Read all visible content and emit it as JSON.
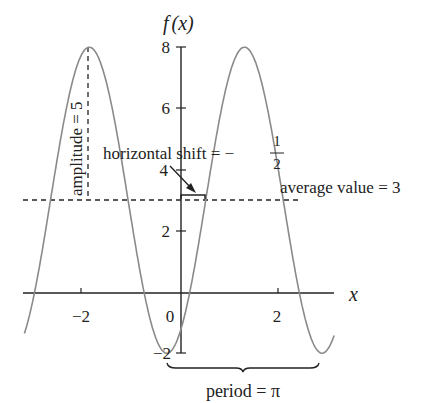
{
  "chart_data": {
    "type": "line",
    "title": "",
    "function": "f(x) = 5 sin(2(x - 1/2)) + 3",
    "xlabel": "x",
    "ylabel": "f (x)",
    "xlim": [
      -3.17,
      3.1
    ],
    "ylim": [
      -2,
      8
    ],
    "x_ticks": [
      -2,
      0,
      2
    ],
    "x_tick_labels": [
      "−2",
      "0",
      "2"
    ],
    "y_ticks": [
      -2,
      2,
      4,
      6,
      8
    ],
    "y_tick_labels": [
      "−2",
      "2",
      "4",
      "6",
      "8"
    ],
    "grid": false,
    "series": [
      {
        "name": "f(x)",
        "color": "#8a8a8a",
        "amplitude": 5,
        "average": 3,
        "period": 3.14159,
        "phase_shift": 0.5,
        "maxima_x": [
          -1.856,
          1.285
        ],
        "minima_x": [
          -0.285,
          2.856
        ],
        "max_value": 8,
        "min_value": -2
      }
    ],
    "annotations": [
      {
        "id": "amplitude",
        "text": "amplitude = 5",
        "orientation": "vertical"
      },
      {
        "id": "average",
        "text": "average value = 3"
      },
      {
        "id": "shift",
        "text": "horizontal shift = −",
        "fraction_num": "1",
        "fraction_den": "2"
      },
      {
        "id": "period",
        "text": "period = π"
      }
    ]
  },
  "labels": {
    "y_axis_f": "f",
    "y_axis_paren": "(x)",
    "x_axis": "x",
    "tick_x_m2": "−2",
    "tick_x_0": "0",
    "tick_x_2": "2",
    "tick_y_8": "8",
    "tick_y_6": "6",
    "tick_y_4": "4",
    "tick_y_2": "2",
    "tick_y_m2": "−2",
    "amplitude": "amplitude = 5",
    "average": "average value = 3",
    "shift": "horizontal shift = −",
    "shift_num": "1",
    "shift_den": "2",
    "period": "period = π"
  }
}
